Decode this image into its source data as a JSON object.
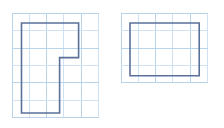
{
  "canvas": {
    "width": 224,
    "height": 128,
    "background_color": "#ffffff"
  },
  "grid": {
    "cell_size_px": 17.3,
    "line_color": "#cfe2f3",
    "line_color_strong": "#b8d4ea",
    "line_width_px": 1,
    "visible": true
  },
  "style": {
    "shape_stroke_color": "#5a7199",
    "shape_stroke_width_px": 1.6,
    "shape_fill": "none"
  },
  "figures": [
    {
      "name": "left-shape",
      "label": "l-shaped-polygon",
      "vertex_count": 6,
      "origin_px": {
        "x": 21.5,
        "y": 23.0
      },
      "vertices_grid": [
        [
          0,
          0
        ],
        [
          3.3,
          0
        ],
        [
          3.3,
          2.0
        ],
        [
          2.2,
          2.0
        ],
        [
          2.2,
          5.2
        ],
        [
          0,
          5.2
        ]
      ],
      "vertices_px": [
        [
          21.5,
          23.0
        ],
        [
          78.6,
          23.0
        ],
        [
          78.6,
          57.6
        ],
        [
          59.6,
          57.6
        ],
        [
          59.6,
          113.0
        ],
        [
          21.5,
          113.0
        ]
      ],
      "grid_columns": 5,
      "grid_rows": 6,
      "grid_origin_px": {
        "x": 12.0,
        "y": 13.5
      }
    },
    {
      "name": "right-shape",
      "label": "rectangle",
      "vertex_count": 4,
      "origin_px": {
        "x": 130.0,
        "y": 23.0
      },
      "vertices_grid": [
        [
          0,
          0
        ],
        [
          4.0,
          0
        ],
        [
          4.0,
          3.05
        ],
        [
          0,
          3.05
        ]
      ],
      "vertices_px": [
        [
          130.0,
          23.0
        ],
        [
          199.2,
          23.0
        ],
        [
          199.2,
          75.8
        ],
        [
          130.0,
          75.8
        ]
      ],
      "grid_columns": 5,
      "grid_rows": 4,
      "grid_origin_px": {
        "x": 121.0,
        "y": 13.5
      }
    }
  ]
}
